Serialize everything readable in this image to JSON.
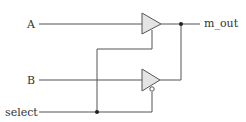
{
  "diagram": {
    "type": "circuit",
    "inputs": [
      {
        "id": "A",
        "label": "A"
      },
      {
        "id": "B",
        "label": "B"
      },
      {
        "id": "select",
        "label": "select"
      }
    ],
    "outputs": [
      {
        "id": "m_out",
        "label": "m_out"
      }
    ],
    "components": [
      {
        "id": "buf_top",
        "kind": "tri-state buffer",
        "enable": "active-high",
        "data_in": "A"
      },
      {
        "id": "buf_bottom",
        "kind": "tri-state buffer",
        "enable": "active-low",
        "data_in": "B"
      }
    ],
    "colors": {
      "wire": "#555555",
      "buffer_fill": "#e4e4e4",
      "junction": "#222222",
      "text": "#333333"
    }
  }
}
